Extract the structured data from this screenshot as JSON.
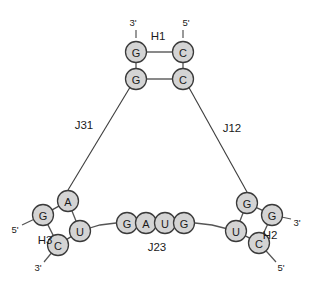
{
  "diagram": {
    "kind": "rna-secondary-structure",
    "width": 314,
    "height": 284,
    "background": "#ffffff",
    "colors": {
      "nucleotide_fill": "#d4d4d4",
      "nucleotide_stroke": "#3a3a3a",
      "bond_stroke": "#4a4a4a",
      "backbone_stroke": "#555555",
      "text": "#1a1a1a"
    }
  },
  "helices": [
    {
      "id": "H1",
      "label": "H1",
      "label_x": 158,
      "label_y": 36,
      "nucleotides": [
        {
          "base": "G",
          "x": 136,
          "y": 52,
          "name": "h1-g-upper-left"
        },
        {
          "base": "C",
          "x": 183,
          "y": 52,
          "name": "h1-c-upper-right"
        },
        {
          "base": "G",
          "x": 136,
          "y": 79,
          "name": "h1-g-lower-left"
        },
        {
          "base": "C",
          "x": 183,
          "y": 79,
          "name": "h1-c-lower-right"
        }
      ],
      "pairs": [
        [
          0,
          1
        ],
        [
          2,
          3
        ]
      ],
      "strand_bonds": [
        [
          0,
          2
        ],
        [
          1,
          3
        ]
      ],
      "ends": [
        {
          "label": "3'",
          "x": 133,
          "y": 22,
          "anchor_x": 136,
          "anchor_y": 38,
          "tip_x": 136,
          "tip_y": 30
        },
        {
          "label": "5'",
          "x": 186,
          "y": 22,
          "anchor_x": 183,
          "anchor_y": 38,
          "tip_x": 183,
          "tip_y": 30
        }
      ]
    },
    {
      "id": "H2",
      "label": "H2",
      "label_x": 270,
      "label_y": 235,
      "nucleotides": [
        {
          "base": "G",
          "x": 247,
          "y": 203,
          "name": "h2-g-upper-left"
        },
        {
          "base": "G",
          "x": 272,
          "y": 215,
          "name": "h2-g-upper-right"
        },
        {
          "base": "U",
          "x": 236,
          "y": 231,
          "name": "h2-u-lower-left"
        },
        {
          "base": "C",
          "x": 259,
          "y": 243,
          "name": "h2-c-lower-right"
        }
      ],
      "pairs": [
        [
          0,
          1
        ],
        [
          2,
          3
        ]
      ],
      "strand_bonds": [
        [
          0,
          2
        ],
        [
          1,
          3
        ]
      ],
      "ends": [
        {
          "label": "3'",
          "x": 297,
          "y": 222,
          "anchor_x": 272,
          "anchor_y": 215,
          "tip_x": 291,
          "tip_y": 219
        },
        {
          "label": "5'",
          "x": 281,
          "y": 267,
          "anchor_x": 259,
          "anchor_y": 243,
          "tip_x": 276,
          "tip_y": 262
        }
      ]
    },
    {
      "id": "H3",
      "label": "H3",
      "label_x": 45,
      "label_y": 240,
      "nucleotides": [
        {
          "base": "A",
          "x": 68,
          "y": 201,
          "name": "h3-a-upper-right"
        },
        {
          "base": "G",
          "x": 43,
          "y": 215,
          "name": "h3-g-upper-left"
        },
        {
          "base": "U",
          "x": 80,
          "y": 231,
          "name": "h3-u-lower-right"
        },
        {
          "base": "C",
          "x": 58,
          "y": 245,
          "name": "h3-c-lower-left"
        }
      ],
      "pairs": [
        [
          0,
          1
        ],
        [
          2,
          3
        ]
      ],
      "strand_bonds": [
        [
          1,
          3
        ],
        [
          0,
          2
        ]
      ],
      "ends": [
        {
          "label": "5'",
          "x": 15,
          "y": 229,
          "anchor_x": 43,
          "anchor_y": 215,
          "tip_x": 22,
          "tip_y": 225
        },
        {
          "label": "3'",
          "x": 38,
          "y": 267,
          "anchor_x": 58,
          "anchor_y": 245,
          "tip_x": 44,
          "tip_y": 262
        }
      ]
    }
  ],
  "loops": [
    {
      "id": "J23",
      "label": "J23",
      "label_x": 157,
      "label_y": 247,
      "nucleotides": [
        {
          "base": "G",
          "x": 127,
          "y": 223,
          "name": "j23-g-1"
        },
        {
          "base": "A",
          "x": 146,
          "y": 223,
          "name": "j23-a-2"
        },
        {
          "base": "U",
          "x": 165,
          "y": 223,
          "name": "j23-u-3"
        },
        {
          "base": "G",
          "x": 184,
          "y": 223,
          "name": "j23-g-4"
        }
      ],
      "left_connector": "M 80 231 L 100 225 L 116 223",
      "right_connector": "M 195 223 L 212 225 L 236 231"
    }
  ],
  "junctions": [
    {
      "id": "J31",
      "label": "J31",
      "label_x": 84,
      "label_y": 125,
      "path": "M 132 84 L 68 190"
    },
    {
      "id": "J12",
      "label": "J12",
      "label_x": 232,
      "label_y": 128,
      "path": "M 187 84 L 247 192"
    }
  ],
  "nucleotide_radius": 10.5
}
